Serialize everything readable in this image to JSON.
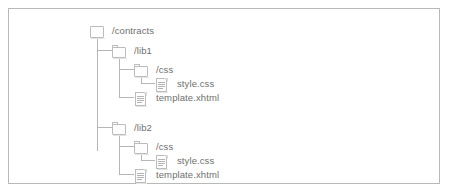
{
  "diagram": {
    "type": "file-tree",
    "title": "",
    "border_color": "#b9b9b9",
    "line_color": "#b6b6b6",
    "text_color": "#6f6f6f",
    "nodes": [
      {
        "id": "contracts",
        "label": "/contracts",
        "kind": "folder",
        "depth": 0
      },
      {
        "id": "lib1",
        "label": "/lib1",
        "kind": "folder",
        "depth": 1
      },
      {
        "id": "lib1-css",
        "label": "/css",
        "kind": "folder",
        "depth": 2
      },
      {
        "id": "lib1-css-style",
        "label": "style.css",
        "kind": "file",
        "depth": 3
      },
      {
        "id": "lib1-template",
        "label": "template.xhtml",
        "kind": "file",
        "depth": 2
      },
      {
        "id": "lib2",
        "label": "/lib2",
        "kind": "folder",
        "depth": 1
      },
      {
        "id": "lib2-css",
        "label": "/css",
        "kind": "folder",
        "depth": 2
      },
      {
        "id": "lib2-css-style",
        "label": "style.css",
        "kind": "file",
        "depth": 3
      },
      {
        "id": "lib2-template",
        "label": "template.xhtml",
        "kind": "file",
        "depth": 2
      }
    ],
    "icons": {
      "folder": "folder-icon",
      "file": "file-icon"
    }
  }
}
